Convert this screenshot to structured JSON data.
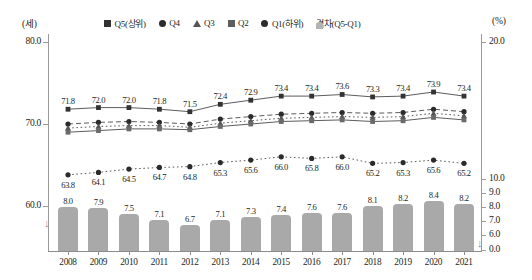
{
  "axes": {
    "left_unit": "(세)",
    "right_unit": "(%)",
    "left_ticks": [
      "80.0",
      "70.0",
      "60.0"
    ],
    "right_ticks": [
      "20.0",
      "10.0",
      "9.0",
      "8.0",
      "7.0",
      "6.0",
      "0.0"
    ],
    "break_glyph": "↓"
  },
  "legend": [
    {
      "label": "Q5(상위)",
      "marker": "square",
      "color": "#333333"
    },
    {
      "label": "Q4",
      "marker": "circle",
      "color": "#2b2b2b"
    },
    {
      "label": "Q3",
      "marker": "triangle",
      "color": "#555555"
    },
    {
      "label": "Q2",
      "marker": "square",
      "color": "#5e5e5e"
    },
    {
      "label": "Q1(하위)",
      "marker": "circle",
      "color": "#2b2b2b"
    },
    {
      "label": "격차(Q5-Q1)",
      "marker": "bar",
      "color": "#b3b3b3"
    }
  ],
  "chart_data": {
    "type": "line",
    "title": "",
    "xlabel": "",
    "ylabel": "(세)",
    "y2label": "(%)",
    "grid": false,
    "legend_position": "top-center",
    "categories": [
      "2008",
      "2009",
      "2010",
      "2011",
      "2012",
      "2013",
      "2014",
      "2015",
      "2016",
      "2017",
      "2018",
      "2019",
      "2020",
      "2021"
    ],
    "ylim": [
      60.0,
      80.0
    ],
    "y2lim": [
      0.0,
      20.0
    ],
    "series": [
      {
        "name": "Q5(상위)",
        "axis": "left",
        "marker": "square",
        "linestyle": "solid",
        "labels_shown": true,
        "values": [
          71.8,
          72.0,
          72.0,
          71.8,
          71.5,
          72.4,
          72.9,
          73.4,
          73.4,
          73.6,
          73.3,
          73.4,
          73.9,
          73.4
        ]
      },
      {
        "name": "Q4",
        "axis": "left",
        "marker": "circle",
        "linestyle": "dashed",
        "labels_shown": false,
        "values": [
          70.0,
          70.2,
          70.3,
          70.2,
          70.0,
          70.6,
          70.9,
          71.2,
          71.3,
          71.4,
          71.3,
          71.4,
          71.8,
          71.5
        ]
      },
      {
        "name": "Q3",
        "axis": "left",
        "marker": "triangle",
        "linestyle": "dotted",
        "labels_shown": false,
        "values": [
          69.5,
          69.7,
          69.8,
          69.8,
          69.6,
          70.1,
          70.4,
          70.7,
          70.8,
          70.9,
          70.8,
          70.9,
          71.3,
          71.0
        ]
      },
      {
        "name": "Q2",
        "axis": "left",
        "marker": "square",
        "linestyle": "solid",
        "labels_shown": false,
        "values": [
          69.0,
          69.2,
          69.4,
          69.4,
          69.3,
          69.7,
          70.0,
          70.3,
          70.4,
          70.5,
          70.3,
          70.4,
          70.8,
          70.5
        ]
      },
      {
        "name": "Q1(하위)",
        "axis": "left",
        "marker": "circle",
        "linestyle": "dotted",
        "labels_shown": true,
        "values": [
          63.8,
          64.1,
          64.5,
          64.7,
          64.8,
          65.3,
          65.6,
          66.0,
          65.8,
          66.0,
          65.2,
          65.3,
          65.6,
          65.2
        ]
      },
      {
        "name": "격차(Q5-Q1)",
        "axis": "right",
        "marker": "bar",
        "linestyle": "none",
        "labels_shown": true,
        "values": [
          8.0,
          7.9,
          7.5,
          7.1,
          6.7,
          7.1,
          7.3,
          7.4,
          7.6,
          7.6,
          8.1,
          8.2,
          8.4,
          8.2
        ]
      }
    ]
  }
}
